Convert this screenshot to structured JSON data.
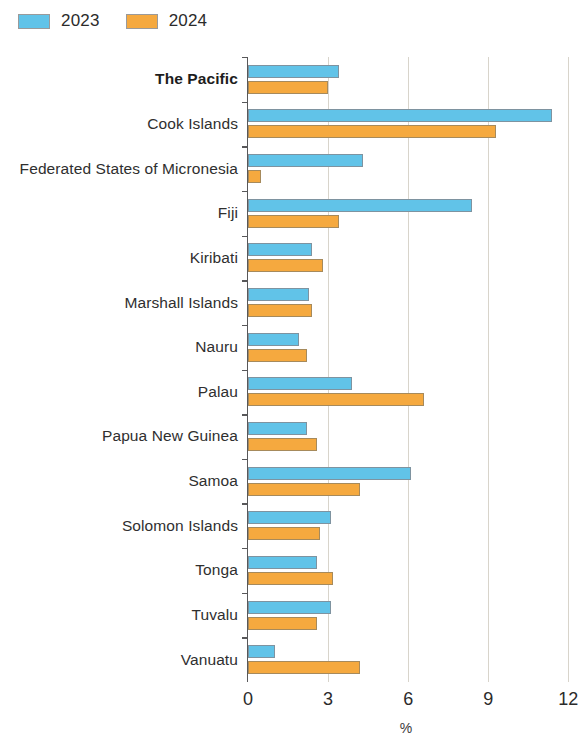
{
  "legend": {
    "position": "top-left",
    "items": [
      {
        "label": "2023",
        "color": "#61c3e8"
      },
      {
        "label": "2024",
        "color": "#f5a93f"
      }
    ]
  },
  "axis": {
    "title": "%",
    "ticks": [
      "0",
      "3",
      "6",
      "9",
      "12"
    ]
  },
  "chart_data": {
    "type": "bar",
    "orientation": "horizontal",
    "title": "",
    "subtitle": "",
    "xlabel": "%",
    "ylabel": "",
    "xlim": [
      0,
      12.4
    ],
    "xticks": [
      0,
      3,
      6,
      9,
      12
    ],
    "grid": true,
    "legend_position": "top-left",
    "categories": [
      "The Pacific",
      "Cook Islands",
      "Federated States of Micronesia",
      "Fiji",
      "Kiribati",
      "Marshall Islands",
      "Nauru",
      "Palau",
      "Papua New Guinea",
      "Samoa",
      "Solomon Islands",
      "Tonga",
      "Tuvalu",
      "Vanuatu"
    ],
    "highlighted_category": "The Pacific",
    "series": [
      {
        "name": "2023",
        "color": "#61c3e8",
        "values": [
          3.4,
          11.4,
          4.3,
          8.4,
          2.4,
          2.3,
          1.9,
          3.9,
          2.2,
          6.1,
          3.1,
          2.6,
          3.1,
          1.0
        ]
      },
      {
        "name": "2024",
        "color": "#f5a93f",
        "values": [
          3.0,
          9.3,
          0.5,
          3.4,
          2.8,
          2.4,
          2.2,
          6.6,
          2.6,
          4.2,
          2.7,
          3.2,
          2.6,
          4.2
        ]
      }
    ]
  }
}
